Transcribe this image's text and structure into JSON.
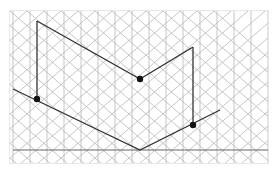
{
  "canvas": {
    "label": "isometric-grid-canvas",
    "width": 258,
    "height": 152,
    "background_color": "#ffffff",
    "border_color": "#e8e8e8"
  },
  "grid": {
    "type": "isometric-triangular",
    "line_color": "#b8b8b8",
    "line_width": 0.8,
    "column_spacing": 17,
    "row_spacing": 29.4,
    "angles_deg": [
      60,
      120,
      90
    ],
    "vertical_line_count": 17,
    "horizontal_row_count": 7
  },
  "figure": {
    "stroke_color": "#333333",
    "stroke_width": 1.3,
    "dot_color": "#111111",
    "dot_radius": 3.2,
    "baseline_color": "#555555",
    "baseline_width": 0.9,
    "polylines": [
      {
        "name": "upper-chevron",
        "points": "27,10 130,68 183,36"
      },
      {
        "name": "lower-chevron",
        "points": "3,78 130,139 210,99"
      }
    ],
    "verticals": [
      {
        "name": "left-riser",
        "x": 27,
        "y1": 10,
        "y2": 88
      },
      {
        "name": "right-riser",
        "x": 183,
        "y1": 36,
        "y2": 114
      }
    ],
    "baseline": {
      "name": "ground-line",
      "x1": 3,
      "x2": 258,
      "y": 139
    },
    "vertices": [
      {
        "name": "vertex-left",
        "cx": 27,
        "cy": 88
      },
      {
        "name": "vertex-apex",
        "cx": 130,
        "cy": 68
      },
      {
        "name": "vertex-right",
        "cx": 183,
        "cy": 114
      }
    ]
  }
}
